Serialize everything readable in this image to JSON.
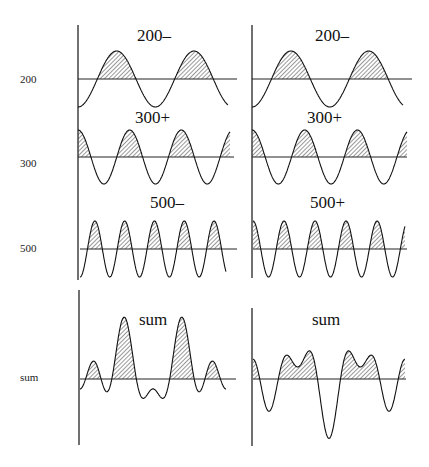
{
  "chart_data": {
    "type": "line",
    "title": "",
    "row_labels": [
      "200",
      "300",
      "500",
      "sum"
    ],
    "columns": [
      {
        "panels": [
          {
            "label": "200–",
            "freq": 2,
            "amp": 1,
            "phase": "minus"
          },
          {
            "label": "300+",
            "freq": 3,
            "amp": 1,
            "phase": "plus"
          },
          {
            "label": "500–",
            "freq": 5,
            "amp": 1,
            "phase": "minus"
          },
          {
            "label": "sum"
          }
        ]
      },
      {
        "panels": [
          {
            "label": "200–",
            "freq": 2,
            "amp": 1,
            "phase": "minus"
          },
          {
            "label": "300+",
            "freq": 3,
            "amp": 1,
            "phase": "plus"
          },
          {
            "label": "500+",
            "freq": 5,
            "amp": 1,
            "phase": "plus"
          },
          {
            "label": "sum"
          }
        ]
      }
    ],
    "legend": "hatched = positive portion"
  },
  "labels": {
    "row200": "200",
    "row300": "300",
    "row500": "500",
    "rowsum": "sum",
    "l200": "200–",
    "l300": "300+",
    "l500": "500–",
    "lsum": "sum",
    "r200": "200–",
    "r300": "300+",
    "r500": "500+",
    "rsum": "sum"
  }
}
